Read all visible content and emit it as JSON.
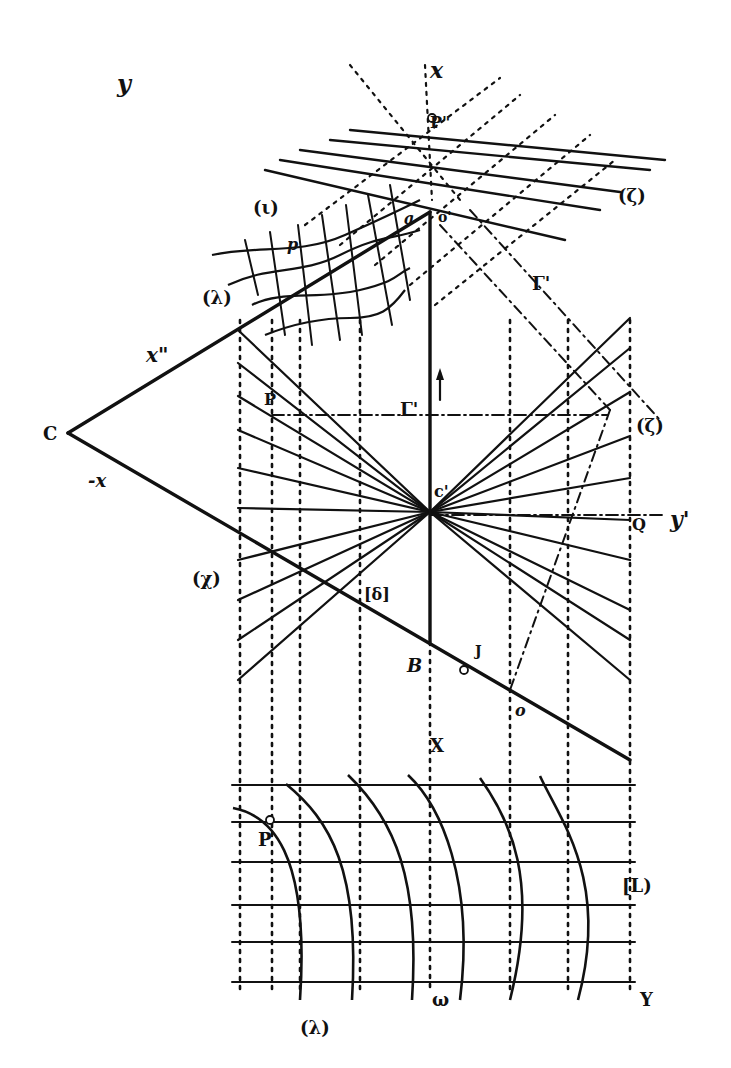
{
  "figure": {
    "type": "descriptive-geometry-construction",
    "ink_color": "#111111",
    "paper_color": "#ffffff",
    "labels": [
      {
        "id": "y-top",
        "text": "y",
        "x": 117,
        "y": 92,
        "size": 24,
        "italic": true
      },
      {
        "id": "x-top",
        "text": "x",
        "x": 430,
        "y": 78,
        "size": 22,
        "italic": true
      },
      {
        "id": "P-dd",
        "text": "P\"",
        "x": 430,
        "y": 128,
        "size": 16,
        "italic": false
      },
      {
        "id": "zeta-top",
        "text": "(ζ)",
        "x": 618,
        "y": 202,
        "size": 18,
        "italic": false
      },
      {
        "id": "iota-top",
        "text": "(ι)",
        "x": 253,
        "y": 214,
        "size": 18,
        "italic": false
      },
      {
        "id": "a-top",
        "text": "a",
        "x": 404,
        "y": 224,
        "size": 16,
        "italic": true
      },
      {
        "id": "O-top",
        "text": "o'",
        "x": 438,
        "y": 222,
        "size": 14,
        "italic": false
      },
      {
        "id": "p-top",
        "text": "p",
        "x": 287,
        "y": 250,
        "size": 16,
        "italic": true
      },
      {
        "id": "lambda-mid",
        "text": "(λ)",
        "x": 202,
        "y": 304,
        "size": 18,
        "italic": false
      },
      {
        "id": "x-dd",
        "text": "x\"",
        "x": 146,
        "y": 362,
        "size": 20,
        "italic": true
      },
      {
        "id": "Gamma-right",
        "text": "Γ'",
        "x": 532,
        "y": 290,
        "size": 18,
        "italic": false
      },
      {
        "id": "C-left",
        "text": "C",
        "x": 43,
        "y": 440,
        "size": 18,
        "italic": false
      },
      {
        "id": "minus-x",
        "text": "-x",
        "x": 88,
        "y": 487,
        "size": 18,
        "italic": true
      },
      {
        "id": "P-upper",
        "text": "P",
        "x": 264,
        "y": 405,
        "size": 16,
        "italic": false
      },
      {
        "id": "Gamma-mid",
        "text": "Γ'",
        "x": 400,
        "y": 416,
        "size": 18,
        "italic": false
      },
      {
        "id": "zeta-right",
        "text": "(ζ)",
        "x": 636,
        "y": 432,
        "size": 18,
        "italic": false
      },
      {
        "id": "C-prime",
        "text": "c'",
        "x": 434,
        "y": 497,
        "size": 16,
        "italic": false
      },
      {
        "id": "Q-right",
        "text": "Q",
        "x": 632,
        "y": 530,
        "size": 16,
        "italic": false
      },
      {
        "id": "y-prime",
        "text": "y'",
        "x": 670,
        "y": 527,
        "size": 22,
        "italic": true
      },
      {
        "id": "chi-left",
        "text": "(χ)",
        "x": 192,
        "y": 585,
        "size": 18,
        "italic": false
      },
      {
        "id": "delta",
        "text": "[δ]",
        "x": 364,
        "y": 600,
        "size": 16,
        "italic": false
      },
      {
        "id": "B-mid",
        "text": "B",
        "x": 407,
        "y": 672,
        "size": 18,
        "italic": true
      },
      {
        "id": "J-mid",
        "text": "J",
        "x": 475,
        "y": 656,
        "size": 14,
        "italic": false
      },
      {
        "id": "o-lower",
        "text": "o",
        "x": 515,
        "y": 716,
        "size": 16,
        "italic": true
      },
      {
        "id": "X-lower",
        "text": "X",
        "x": 430,
        "y": 752,
        "size": 18,
        "italic": false
      },
      {
        "id": "P-lower",
        "text": "P",
        "x": 258,
        "y": 846,
        "size": 18,
        "italic": false
      },
      {
        "id": "L-right",
        "text": "[L)",
        "x": 622,
        "y": 892,
        "size": 18,
        "italic": false
      },
      {
        "id": "lambda-bottom",
        "text": "(λ)",
        "x": 300,
        "y": 1034,
        "size": 18,
        "italic": false
      },
      {
        "id": "omega-bottom",
        "text": "ω",
        "x": 432,
        "y": 1006,
        "size": 18,
        "italic": false
      },
      {
        "id": "Y-bottom",
        "text": "Y",
        "x": 640,
        "y": 1006,
        "size": 18,
        "italic": false
      }
    ],
    "points": {
      "C": [
        68,
        433
      ],
      "C_prime": [
        430,
        512
      ],
      "A_top": [
        430,
        213
      ],
      "B": [
        430,
        641
      ],
      "J": [
        464,
        670
      ],
      "P_pp": [
        432,
        118
      ],
      "P_low": [
        270,
        820
      ]
    },
    "solid_lines": [
      {
        "id": "x-dd-axis",
        "from": [
          68,
          433
        ],
        "to": [
          430,
          212
        ]
      },
      {
        "id": "minus-x-axis",
        "from": [
          68,
          433
        ],
        "to": [
          630,
          760
        ]
      },
      {
        "id": "vertical-axis",
        "from": [
          430,
          212
        ],
        "to": [
          430,
          642
        ]
      }
    ],
    "fan": {
      "center": [
        430,
        512
      ],
      "left_ends": [
        [
          238,
          330
        ],
        [
          238,
          363
        ],
        [
          238,
          396
        ],
        [
          238,
          430
        ],
        [
          238,
          468
        ],
        [
          238,
          508
        ],
        [
          238,
          560
        ],
        [
          238,
          600
        ],
        [
          238,
          640
        ],
        [
          238,
          680
        ]
      ],
      "right_ends": [
        [
          630,
          318
        ],
        [
          630,
          348
        ],
        [
          630,
          392
        ],
        [
          630,
          436
        ],
        [
          630,
          478
        ],
        [
          630,
          520
        ],
        [
          630,
          560
        ],
        [
          630,
          610
        ],
        [
          630,
          640
        ],
        [
          630,
          680
        ]
      ]
    },
    "verticals_dotted": [
      240,
      272,
      300,
      360,
      430,
      510,
      568,
      630
    ],
    "horizontal_dashdot": [
      {
        "from": [
          272,
          415
        ],
        "to": [
          608,
          415
        ]
      },
      {
        "from": [
          430,
          515
        ],
        "to": [
          665,
          515
        ]
      }
    ],
    "diag_dashdot": [
      {
        "from": [
          440,
          225
        ],
        "to": [
          610,
          410
        ]
      },
      {
        "from": [
          470,
          210
        ],
        "to": [
          660,
          420
        ]
      },
      {
        "from": [
          610,
          410
        ],
        "to": [
          510,
          690
        ]
      }
    ],
    "top_grid": {
      "solid": [
        {
          "from": [
            350,
            130
          ],
          "to": [
            665,
            160
          ]
        },
        {
          "from": [
            330,
            140
          ],
          "to": [
            650,
            170
          ]
        },
        {
          "from": [
            300,
            150
          ],
          "to": [
            620,
            192
          ]
        },
        {
          "from": [
            280,
            160
          ],
          "to": [
            600,
            210
          ]
        },
        {
          "from": [
            265,
            170
          ],
          "to": [
            565,
            240
          ]
        }
      ],
      "dotted": [
        {
          "from": [
            305,
            225
          ],
          "to": [
            500,
            78
          ]
        },
        {
          "from": [
            340,
            245
          ],
          "to": [
            520,
            95
          ]
        },
        {
          "from": [
            375,
            265
          ],
          "to": [
            555,
            115
          ]
        },
        {
          "from": [
            410,
            285
          ],
          "to": [
            590,
            135
          ]
        },
        {
          "from": [
            435,
            305
          ],
          "to": [
            615,
            160
          ]
        },
        {
          "from": [
            350,
            65
          ],
          "to": [
            460,
            200
          ]
        },
        {
          "from": [
            425,
            65
          ],
          "to": [
            432,
            200
          ]
        }
      ]
    },
    "warped_grid": {
      "curves": [
        "M 212 255 C 260 245, 300 255, 345 235 S 400 210, 420 200",
        "M 228 285 C 270 265, 300 275, 340 255 S 390 240, 420 230",
        "M 252 305 C 280 290, 320 300, 360 290 S 395 275, 410 268",
        "M 265 335 C 290 325, 320 318, 350 318 S 390 310, 405 290"
      ],
      "ribs": [
        {
          "from": [
            245,
            240
          ],
          "to": [
            258,
            295
          ]
        },
        {
          "from": [
            270,
            232
          ],
          "to": [
            285,
            335
          ]
        },
        {
          "from": [
            298,
            225
          ],
          "to": [
            312,
            345
          ]
        },
        {
          "from": [
            322,
            215
          ],
          "to": [
            340,
            340
          ]
        },
        {
          "from": [
            346,
            205
          ],
          "to": [
            362,
            335
          ]
        },
        {
          "from": [
            368,
            195
          ],
          "to": [
            392,
            325
          ]
        },
        {
          "from": [
            390,
            185
          ],
          "to": [
            410,
            300
          ]
        }
      ]
    },
    "bottom_grid": {
      "x_left": 232,
      "x_right": 635,
      "rows_y": [
        785,
        822,
        862,
        905,
        942,
        982
      ],
      "arcs": [
        "M 233 808 C 270 815, 310 850, 300 1000",
        "M 286 784 C 330 820, 360 870, 352 1000",
        "M 348 775 C 395 820, 420 880, 412 1000",
        "M 408 775 C 440 805, 475 880, 460 1000",
        "M 480 778 C 510 820, 540 880, 510 1000",
        "M 540 776 C 560 820, 610 880, 578 1000"
      ]
    }
  }
}
